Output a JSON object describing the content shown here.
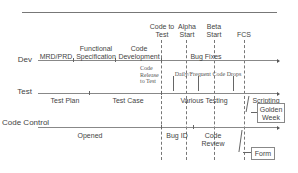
{
  "rows": {
    "dev": "Dev",
    "test": "Test",
    "code_control": "Code Control"
  },
  "milestones": {
    "code_to_test": "Code to Test",
    "alpha_start": "Alpha Start",
    "beta_start": "Beta Start",
    "fcs": "FCS"
  },
  "dev_phases": {
    "mrd_prd": "MRD/PRD",
    "functional_spec": "Functional Specification",
    "code_dev": "Code Development",
    "bug_fixes": "Bug Fixes"
  },
  "annotations": {
    "code_release": "Code Release to Test",
    "daily_drops": "Daily/Frequent Code Drops"
  },
  "test_phases": {
    "test_plan": "Test Plan",
    "test_case": "Test Case",
    "various_testing": "Various Testing",
    "scripting": "Scripting"
  },
  "control_phases": {
    "opened": "Opened",
    "bug_id": "Bug ID",
    "code_review": "Code Review"
  },
  "callouts": {
    "golden_week": "Golden Week",
    "form": "Form"
  },
  "colors": {
    "line": "#888888",
    "text": "#444444"
  }
}
